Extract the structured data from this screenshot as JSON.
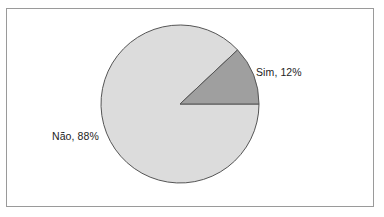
{
  "chart_data": {
    "type": "pie",
    "title": "",
    "subtitle": "",
    "xlabel": "",
    "ylabel": "",
    "grid": false,
    "legend_position": "none",
    "labels_inline": true,
    "categories": [
      "Sim",
      "Não"
    ],
    "values": [
      12,
      88
    ],
    "units": "%",
    "slices": [
      {
        "name": "Sim",
        "value": 12,
        "label": "Sim, 12%",
        "color": "#9f9f9f",
        "start_angle_deg": 0,
        "end_angle_deg": 43.2
      },
      {
        "name": "Não",
        "value": 88,
        "label": "Não, 88%",
        "color": "#dcdcdc",
        "start_angle_deg": 43.2,
        "end_angle_deg": 360
      }
    ],
    "annotations": [
      "Sim, 12%",
      "Não, 88%"
    ]
  },
  "figure": {
    "frame_color": "#9a9a9a",
    "background": "#ffffff",
    "outline_color": "#555555",
    "center_x": 180,
    "center_y": 104,
    "radius": 79
  }
}
